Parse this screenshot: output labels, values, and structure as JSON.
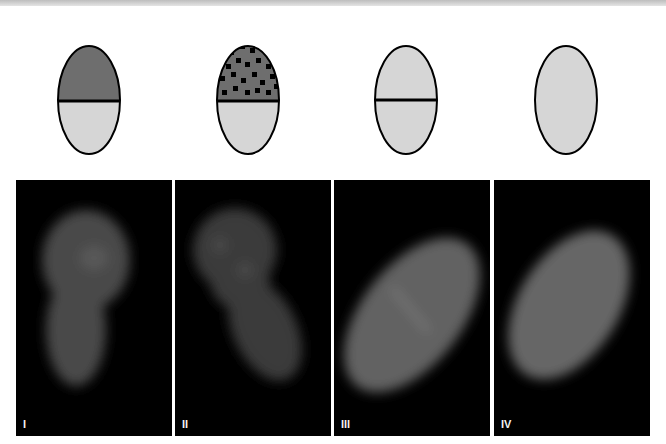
{
  "figure": {
    "schematics": [
      {
        "id": "I",
        "top_fill": "#6e6e6e",
        "bottom_fill": "#d6d6d6",
        "has_divider": true,
        "pattern": "solid"
      },
      {
        "id": "II",
        "top_fill": "#6e6e6e",
        "bottom_fill": "#d6d6d6",
        "has_divider": true,
        "pattern": "speckled"
      },
      {
        "id": "III",
        "top_fill": "#d6d6d6",
        "bottom_fill": "#d6d6d6",
        "has_divider": true,
        "pattern": "none"
      },
      {
        "id": "IV",
        "top_fill": "#d6d6d6",
        "bottom_fill": "#d6d6d6",
        "has_divider": false,
        "pattern": "none"
      }
    ],
    "panels": [
      {
        "label": "I",
        "description": "fluorescent embryo, brighter anterior half"
      },
      {
        "label": "II",
        "description": "fluorescent embryo, speckled anterior signal"
      },
      {
        "label": "III",
        "description": "fluorescent embryo with faint mid stripe"
      },
      {
        "label": "IV",
        "description": "uniform fluorescent embryo"
      }
    ],
    "colors": {
      "outline": "#000000",
      "dark_fill": "#6e6e6e",
      "light_fill": "#d6d6d6",
      "panel_bg": "#000000",
      "label": "#f2f2f2"
    }
  }
}
